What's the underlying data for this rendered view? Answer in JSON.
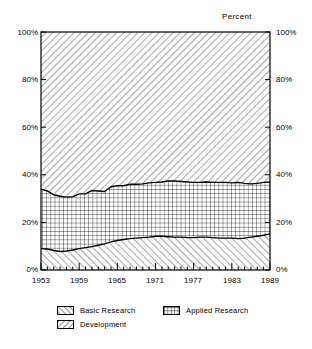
{
  "chart_data": {
    "type": "area",
    "stacked": true,
    "normalized": true,
    "title": "",
    "subtitle": "",
    "xlabel": "",
    "ylabel": "Percent",
    "axis_unit_label": "Percent",
    "xlim": [
      1953,
      1989
    ],
    "ylim": [
      0,
      100
    ],
    "grid": false,
    "legend_position": "below",
    "y_ticks": [
      0,
      20,
      40,
      60,
      80,
      100
    ],
    "y_tick_labels": [
      "0%",
      "20%",
      "40%",
      "60%",
      "80%",
      "100%"
    ],
    "y_tick_labels_right": [
      "0%",
      "20%",
      "40%",
      "60%",
      "80%",
      "100%"
    ],
    "x_ticks": [
      1953,
      1959,
      1965,
      1971,
      1977,
      1983,
      1989
    ],
    "x_tick_labels": [
      "1953",
      "1959",
      "1965",
      "1971",
      "1977",
      "1983",
      "1989"
    ],
    "x_minor_tick_interval": 1,
    "x": [
      1953,
      1954,
      1955,
      1956,
      1957,
      1958,
      1959,
      1960,
      1961,
      1962,
      1963,
      1964,
      1965,
      1966,
      1967,
      1968,
      1969,
      1970,
      1971,
      1972,
      1973,
      1974,
      1975,
      1976,
      1977,
      1978,
      1979,
      1980,
      1981,
      1982,
      1983,
      1984,
      1985,
      1986,
      1987,
      1988,
      1989
    ],
    "series": [
      {
        "name": "Basic Research",
        "pattern": "forward-diagonal-hatch",
        "values": [
          9.0,
          8.8,
          8.2,
          7.8,
          8.0,
          8.4,
          9.0,
          9.4,
          9.8,
          10.4,
          11.0,
          11.8,
          12.4,
          12.8,
          13.2,
          13.4,
          13.6,
          13.8,
          14.2,
          14.2,
          14.0,
          13.8,
          13.8,
          13.6,
          13.6,
          13.8,
          13.8,
          13.6,
          13.4,
          13.4,
          13.4,
          13.2,
          13.4,
          13.8,
          14.2,
          14.6,
          15.2
        ]
      },
      {
        "name": "Applied Research",
        "pattern": "grid-crosshatch",
        "values": [
          25.0,
          24.4,
          23.4,
          23.2,
          22.6,
          22.4,
          23.0,
          22.6,
          23.6,
          22.8,
          22.0,
          23.2,
          23.0,
          22.6,
          22.8,
          22.6,
          22.6,
          22.8,
          22.6,
          22.8,
          23.4,
          23.6,
          23.4,
          23.4,
          23.2,
          23.0,
          23.2,
          23.2,
          23.4,
          23.4,
          23.2,
          23.6,
          23.0,
          22.4,
          22.2,
          22.2,
          21.8
        ]
      },
      {
        "name": "Development",
        "pattern": "backward-diagonal-hatch",
        "values": [
          66.0,
          66.8,
          68.4,
          69.0,
          69.4,
          69.2,
          68.0,
          68.0,
          66.6,
          66.8,
          67.0,
          65.0,
          64.6,
          64.6,
          64.0,
          64.0,
          63.8,
          63.4,
          63.2,
          63.0,
          62.6,
          62.6,
          62.8,
          63.0,
          63.2,
          63.2,
          63.0,
          63.2,
          63.2,
          63.2,
          63.4,
          63.2,
          63.6,
          63.8,
          63.6,
          63.2,
          63.0
        ]
      }
    ],
    "cumulative_basic": [
      9.0,
      8.8,
      8.2,
      7.8,
      8.0,
      8.4,
      9.0,
      9.4,
      9.8,
      10.4,
      11.0,
      11.8,
      12.4,
      12.8,
      13.2,
      13.4,
      13.6,
      13.8,
      14.2,
      14.2,
      14.0,
      13.8,
      13.8,
      13.6,
      13.6,
      13.8,
      13.8,
      13.6,
      13.4,
      13.4,
      13.4,
      13.2,
      13.4,
      13.8,
      14.2,
      14.6,
      15.2
    ],
    "cumulative_applied": [
      34.0,
      33.2,
      31.6,
      31.0,
      30.6,
      30.8,
      32.0,
      32.0,
      33.4,
      33.2,
      33.0,
      35.0,
      35.4,
      35.4,
      36.0,
      36.0,
      36.2,
      36.6,
      36.8,
      37.0,
      37.4,
      37.4,
      37.2,
      37.0,
      36.8,
      36.8,
      37.0,
      36.8,
      36.8,
      36.8,
      36.6,
      36.8,
      36.4,
      36.2,
      36.4,
      36.8,
      37.0
    ]
  },
  "axes": {
    "unit_caption": "Percent",
    "y_left": [
      "100%",
      "80%",
      "60%",
      "40%",
      "20%",
      "0%"
    ],
    "y_right": [
      "100%",
      "80%",
      "60%",
      "40%",
      "20%",
      "0%"
    ],
    "x": [
      "1953",
      "1959",
      "1965",
      "1971",
      "1977",
      "1983",
      "1989"
    ]
  },
  "legend": {
    "items": [
      {
        "label": "Basic Research",
        "pattern": "forward-diagonal-hatch"
      },
      {
        "label": "Applied Research",
        "pattern": "grid-crosshatch"
      },
      {
        "label": "Development",
        "pattern": "backward-diagonal-hatch"
      }
    ]
  },
  "colors": {
    "line": "#000000",
    "background": "#ffffff",
    "text": "#000000"
  }
}
